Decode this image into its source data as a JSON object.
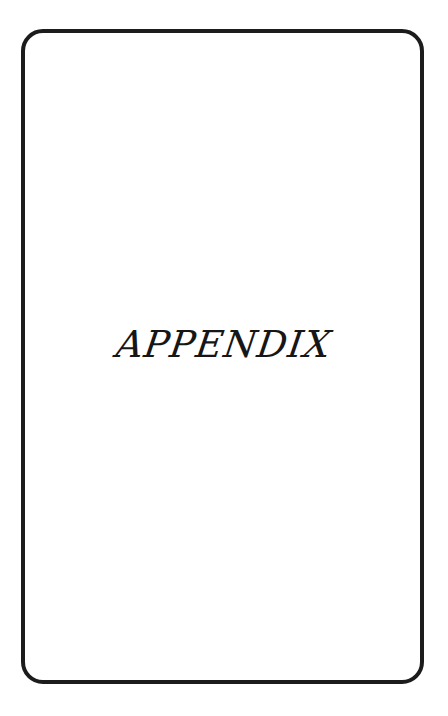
{
  "page": {
    "title": "APPENDIX"
  },
  "colors": {
    "border": "#1c1c1c",
    "text": "#161616",
    "background": "#ffffff"
  }
}
